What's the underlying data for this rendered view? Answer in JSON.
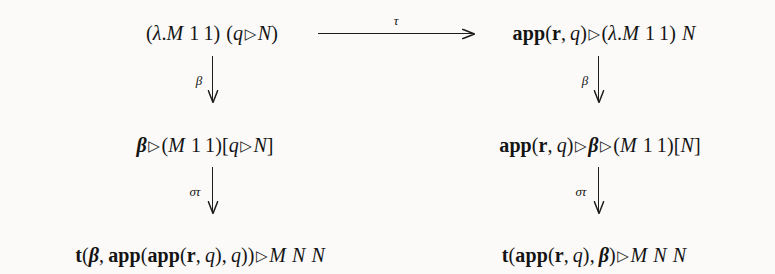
{
  "diagram": {
    "kind": "commutative-diagram",
    "background_color": "#fbfaf8",
    "ink_color": "#141414",
    "nodes": {
      "top_left": "(λ.M 1 1) (q ▷ N)",
      "top_right": "app(r, q) ▷ (λ.M 1 1) N",
      "middle_left": "β ▷ (M 1 1)[q ▷ N]",
      "middle_right": "app(r, q) ▷ β ▷ (M 1 1)[N]",
      "bottom_left": "t(β, app(app(r, q), q)) ▷ M N N",
      "bottom_right": "t(app(r, q), β) ▷ M N N"
    },
    "arrows": {
      "horizontal_top": "τ",
      "left_upper": "β",
      "left_lower": "στ",
      "right_upper": "β",
      "right_lower": "στ"
    },
    "tokens": {
      "lambda": "λ",
      "beta": "β",
      "tau": "τ",
      "sigma": "σ",
      "triangle": "▷",
      "app": "app",
      "t": "t",
      "r": "r",
      "q": "q",
      "M": "M",
      "N": "N",
      "one": "1",
      "dot": ".",
      "comma": ",",
      "lparen": "(",
      "rparen": ")",
      "lbracket": "[",
      "rbracket": "]"
    }
  }
}
